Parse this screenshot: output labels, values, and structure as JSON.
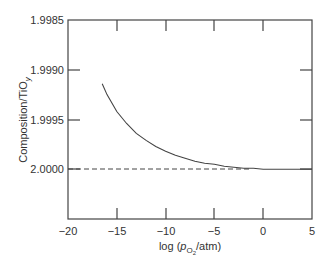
{
  "chart_data": {
    "type": "line",
    "title": "",
    "xlabel": "log (p_O2/atm)",
    "ylabel": "Composition/TiO_y",
    "xlim": [
      -20,
      5
    ],
    "ylim": [
      2.0005,
      1.9985
    ],
    "y_inverted": true,
    "grid": false,
    "legend": null,
    "x_ticks": [
      -20,
      -15,
      -10,
      -5,
      0,
      5
    ],
    "x_tick_labels": [
      "−20",
      "−15",
      "−10",
      "−5",
      "0",
      "5"
    ],
    "y_ticks": [
      1.9985,
      1.999,
      1.9995,
      2.0
    ],
    "y_tick_labels": [
      "1.9985",
      "1.9990",
      "1.9995",
      "2.0000"
    ],
    "series": [
      {
        "name": "TiO_y composition",
        "style": "solid",
        "x": [
          -16.5,
          -16,
          -15,
          -14,
          -13,
          -12,
          -11,
          -10,
          -9,
          -8,
          -7,
          -6,
          -5,
          -4,
          -3,
          -2,
          -1,
          0,
          1,
          2,
          3,
          4,
          5
        ],
        "y": [
          1.99914,
          1.99925,
          1.99942,
          1.99954,
          1.99964,
          1.99971,
          1.99977,
          1.99982,
          1.99986,
          1.99989,
          1.99992,
          1.99994,
          1.99995,
          1.99997,
          1.99998,
          1.99999,
          1.99999,
          2.0,
          2.0,
          2.0,
          2.0,
          2.0,
          2.0
        ]
      },
      {
        "name": "stoichiometric reference",
        "style": "dashed",
        "x": [
          -20,
          5
        ],
        "y": [
          2.0,
          2.0
        ]
      }
    ]
  },
  "axes": {
    "ylabel_main": "Composition/TiO",
    "ylabel_sub": "y",
    "xlabel_pre": "log (",
    "xlabel_p": "p",
    "xlabel_sub": "O",
    "xlabel_subsub": "2",
    "xlabel_post": "/atm)"
  },
  "x_ticks": [
    "−20",
    "−15",
    "−10",
    "−5",
    "0",
    "5"
  ],
  "y_ticks": [
    "1.9985",
    "1.9990",
    "1.9995",
    "2.0000"
  ]
}
